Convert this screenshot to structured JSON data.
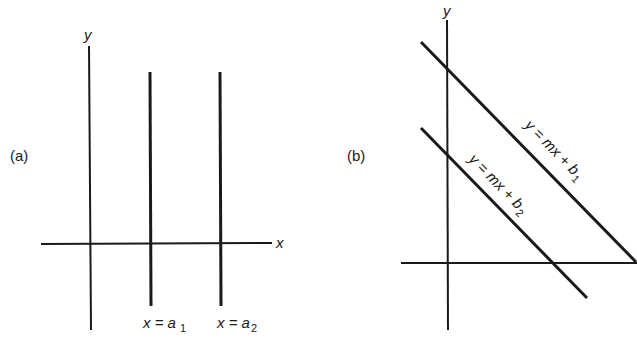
{
  "panel_a": {
    "tag": "(a)",
    "y_axis_label": "y",
    "x_axis_label": "x",
    "lines": [
      {
        "label_var": "x = a",
        "label_sub": "1"
      },
      {
        "label_var": "x = a",
        "label_sub": "2"
      }
    ]
  },
  "panel_b": {
    "tag": "(b)",
    "y_axis_label": "y",
    "lines": [
      {
        "label_var": "y = mx + b",
        "label_sub": "1"
      },
      {
        "label_var": "y = mx + b",
        "label_sub": "2"
      }
    ]
  },
  "colors": {
    "ink": "#1a1a1a",
    "background": "#ffffff"
  }
}
